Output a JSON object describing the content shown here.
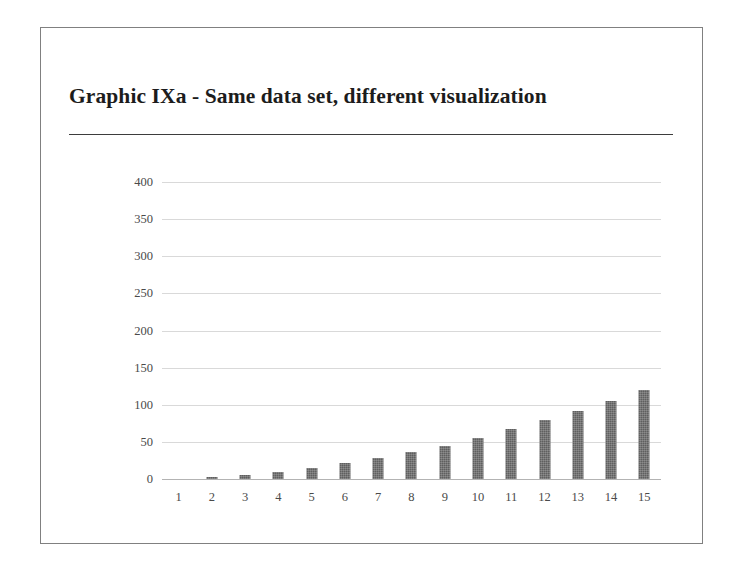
{
  "slide": {
    "title": "Graphic IXa - Same data set, different visualization",
    "background_color": "#ffffff",
    "border_color": "#808080",
    "rule_color": "#3d3d3d"
  },
  "chart_data": {
    "type": "bar",
    "title": "Graphic IXa - Same data set, different visualization",
    "xlabel": "",
    "ylabel": "",
    "categories": [
      "1",
      "2",
      "3",
      "4",
      "5",
      "6",
      "7",
      "8",
      "9",
      "10",
      "11",
      "12",
      "13",
      "14",
      "15"
    ],
    "values": [
      0,
      3,
      6,
      10,
      15,
      21,
      28,
      36,
      45,
      55,
      67,
      79,
      92,
      105,
      120
    ],
    "ylim": [
      0,
      400
    ],
    "ytick_labels": [
      "0",
      "50",
      "100",
      "150",
      "200",
      "250",
      "300",
      "350",
      "400"
    ],
    "ytick_values": [
      0,
      50,
      100,
      150,
      200,
      250,
      300,
      350,
      400
    ],
    "grid": true,
    "grid_color": "#d9d9d9",
    "baseline_color": "#b3b3b3",
    "legend": false,
    "legend_position": "none",
    "bar_color": "#5f5f5f",
    "tick_label_color": "#4a4a4a"
  }
}
